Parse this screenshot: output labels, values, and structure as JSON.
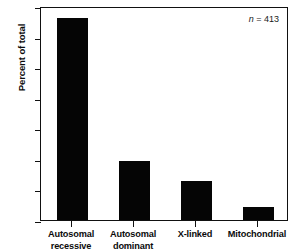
{
  "chart_data": {
    "type": "bar",
    "title": "",
    "xlabel": "",
    "ylabel": "Percent of total",
    "categories": [
      "Autosomal\nrecessive",
      "Autosomal\ndominant",
      "X-linked",
      "Mitochondrial"
    ],
    "values": [
      66,
      19.3,
      12.8,
      4.2
    ],
    "ylim": [
      0,
      70
    ],
    "yticks": [
      0,
      10,
      20,
      30,
      40,
      50,
      60,
      70
    ],
    "ytick_labels": [
      "0",
      "10",
      "20",
      "30",
      "40",
      "50",
      "60",
      "70"
    ],
    "grid": false,
    "legend": null,
    "annotations": [
      {
        "name": "sample-size",
        "italic_prefix": "n",
        "rest": " = 413",
        "position": "top-right"
      }
    ],
    "bar_color": "#050505",
    "axis_color": "#111111"
  },
  "figure": {
    "background": "#ffffff"
  }
}
